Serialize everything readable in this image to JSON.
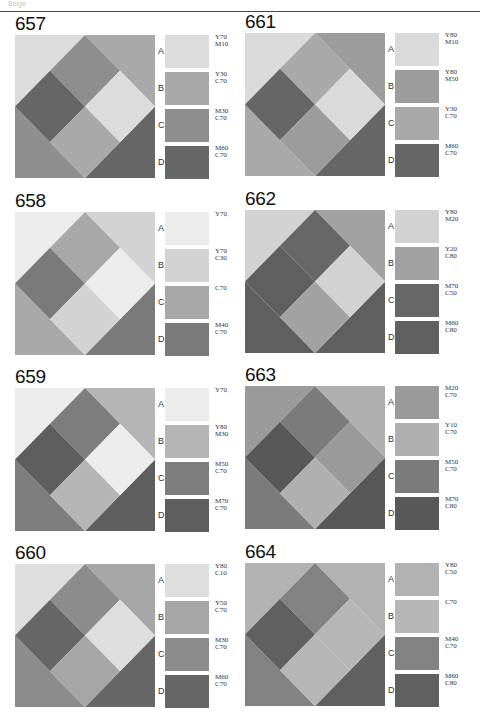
{
  "header": {
    "label": "Beige"
  },
  "panels": [
    {
      "number": "657",
      "swatches": [
        {
          "letter": "A",
          "code": "Y70\nM10",
          "color": "#dcdcdc"
        },
        {
          "letter": "B",
          "code": "Y30\nC70",
          "color": "#a9a9a9"
        },
        {
          "letter": "C",
          "code": "M30\nC70",
          "color": "#8e8e8e"
        },
        {
          "letter": "D",
          "code": "M60\nC70",
          "color": "#666666"
        }
      ],
      "layout": {
        "tl": "A",
        "tr": "B",
        "bl": "C",
        "br": "D",
        "top": "C",
        "left": "D",
        "right": "A",
        "bottom": "B"
      }
    },
    {
      "number": "658",
      "swatches": [
        {
          "letter": "A",
          "code": "Y70",
          "color": "#ececec"
        },
        {
          "letter": "B",
          "code": "Y70\nC30",
          "color": "#d3d3d3"
        },
        {
          "letter": "C",
          "code": "C70",
          "color": "#a8a8a8"
        },
        {
          "letter": "D",
          "code": "M40\nC70",
          "color": "#7a7a7a"
        }
      ],
      "layout": {
        "tl": "A",
        "tr": "B",
        "bl": "C",
        "br": "D",
        "top": "C",
        "left": "D",
        "right": "A",
        "bottom": "B"
      }
    },
    {
      "number": "659",
      "swatches": [
        {
          "letter": "A",
          "code": "Y70",
          "color": "#ececec"
        },
        {
          "letter": "B",
          "code": "Y80\nM30",
          "color": "#b5b5b5"
        },
        {
          "letter": "C",
          "code": "M50\nC70",
          "color": "#7d7d7d"
        },
        {
          "letter": "D",
          "code": "M70\nC70",
          "color": "#5e5e5e"
        }
      ],
      "layout": {
        "tl": "A",
        "tr": "B",
        "bl": "C",
        "br": "D",
        "top": "C",
        "left": "D",
        "right": "A",
        "bottom": "B"
      }
    },
    {
      "number": "660",
      "swatches": [
        {
          "letter": "A",
          "code": "Y80\nC10",
          "color": "#dedede"
        },
        {
          "letter": "B",
          "code": "Y50\nC70",
          "color": "#a6a6a6"
        },
        {
          "letter": "C",
          "code": "M30\nC70",
          "color": "#8c8c8c"
        },
        {
          "letter": "D",
          "code": "M60\nC70",
          "color": "#666666"
        }
      ],
      "layout": {
        "tl": "A",
        "tr": "B",
        "bl": "C",
        "br": "D",
        "top": "C",
        "left": "D",
        "right": "A",
        "bottom": "B"
      }
    },
    {
      "number": "661",
      "swatches": [
        {
          "letter": "A",
          "code": "Y80\nM10",
          "color": "#dadada"
        },
        {
          "letter": "B",
          "code": "Y80\nM50",
          "color": "#9c9c9c"
        },
        {
          "letter": "C",
          "code": "Y30\nC70",
          "color": "#a9a9a9"
        },
        {
          "letter": "D",
          "code": "M60\nC70",
          "color": "#666666"
        }
      ],
      "layout": {
        "tl": "A",
        "tr": "B",
        "bl": "C",
        "br": "D",
        "top": "C",
        "left": "D",
        "right": "A",
        "bottom": "B"
      }
    },
    {
      "number": "662",
      "swatches": [
        {
          "letter": "A",
          "code": "Y80\nM20",
          "color": "#d2d2d2"
        },
        {
          "letter": "B",
          "code": "Y20\nC80",
          "color": "#a2a2a2"
        },
        {
          "letter": "C",
          "code": "M70\nC50",
          "color": "#676767"
        },
        {
          "letter": "D",
          "code": "M60\nC80",
          "color": "#5f5f5f"
        }
      ],
      "layout": {
        "tl": "A",
        "tr": "B",
        "bl": "D",
        "br": "D",
        "top": "C",
        "left": "D",
        "right": "A",
        "bottom": "B"
      }
    },
    {
      "number": "663",
      "swatches": [
        {
          "letter": "A",
          "code": "M20\nC70",
          "color": "#9a9a9a"
        },
        {
          "letter": "B",
          "code": "Y10\nC70",
          "color": "#b0b0b0"
        },
        {
          "letter": "C",
          "code": "M50\nC70",
          "color": "#7b7b7b"
        },
        {
          "letter": "D",
          "code": "M70\nC80",
          "color": "#585858"
        }
      ],
      "layout": {
        "tl": "A",
        "tr": "B",
        "bl": "C",
        "br": "D",
        "top": "C",
        "left": "D",
        "right": "A",
        "bottom": "B"
      }
    },
    {
      "number": "664",
      "swatches": [
        {
          "letter": "A",
          "code": "Y80\nC50",
          "color": "#b2b2b2"
        },
        {
          "letter": "B",
          "code": "C70",
          "color": "#b6b6b6"
        },
        {
          "letter": "C",
          "code": "M40\nC70",
          "color": "#828282"
        },
        {
          "letter": "D",
          "code": "M60\nC80",
          "color": "#606060"
        }
      ],
      "layout": {
        "tl": "A",
        "tr": "A",
        "bl": "C",
        "br": "D",
        "top": "C",
        "left": "D",
        "right": "B",
        "bottom": "B"
      }
    }
  ]
}
